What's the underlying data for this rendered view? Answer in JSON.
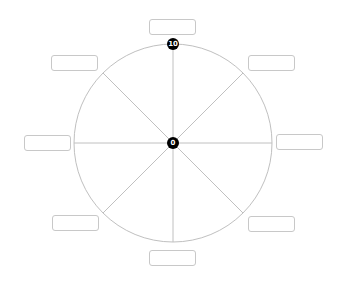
{
  "wheel": {
    "center": [
      173,
      143
    ],
    "radius": 99,
    "stroke_color": "#c0c0c0",
    "spokes": 8,
    "scale_center_label": "0",
    "scale_outer_label": "10"
  },
  "labels": [
    {
      "position": "top",
      "text": ""
    },
    {
      "position": "upper-right",
      "text": ""
    },
    {
      "position": "right",
      "text": ""
    },
    {
      "position": "lower-right",
      "text": ""
    },
    {
      "position": "bottom",
      "text": ""
    },
    {
      "position": "lower-left",
      "text": ""
    },
    {
      "position": "left",
      "text": ""
    },
    {
      "position": "upper-left",
      "text": ""
    }
  ]
}
